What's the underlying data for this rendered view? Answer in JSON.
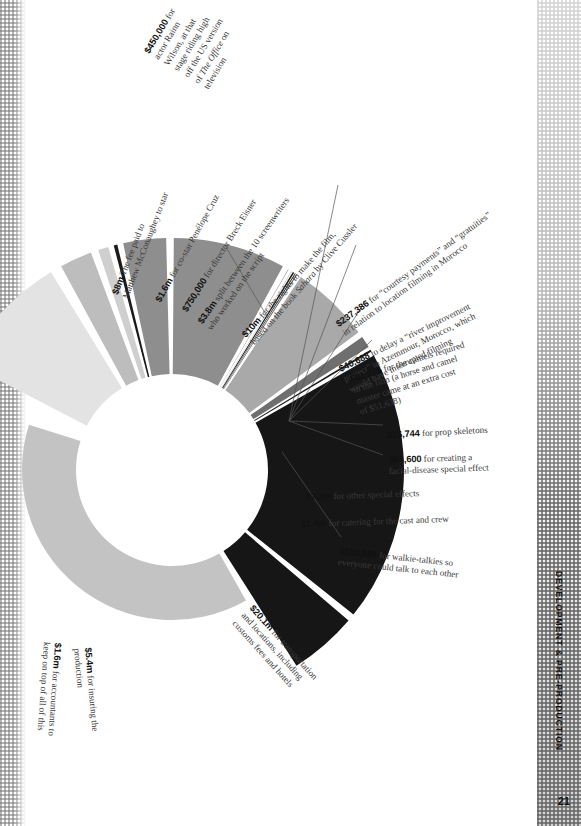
{
  "page": {
    "running_head": "DEVELOPMENT & PRE-PRODUCTION",
    "folio": "21"
  },
  "chart_data": {
    "type": "pie",
    "title": "",
    "subtitle": "",
    "xlabel": "",
    "ylabel": "",
    "legend_position": "callout-labels",
    "grid": false,
    "note": "Exploded doughnut of Sahara (2005) development & pre-production costs; slice angles approximate the printed figure, wedges separated by white gaps, ring cropped at the left page edge.",
    "categories": [
      "Matthew McConaughey fee",
      "Penelope Cruz fee",
      "Rainn Wilson fee",
      "Director Breck Eisner",
      "Screenwriters (10)",
      "Book rights (Sahara)",
      "Courtesy payments / gratuities",
      "River-improvement delay",
      "Camels",
      "Prop skeletons",
      "Facial-disease special effect",
      "Other special effects",
      "Catering",
      "Walkie-talkies",
      "Transportation & locations",
      "Production insurance",
      "Accountants"
    ],
    "values": [
      8000000,
      1600000,
      450000,
      750000,
      3800000,
      10000000,
      237386,
      40688,
      81375,
      16744,
      54600,
      7300000,
      1400000,
      102884,
      20100000,
      5400000,
      1600000
    ],
    "value_labels": [
      "$8m",
      "$1.6m",
      "$450,000",
      "$750,000",
      "$3.8m",
      "$10m",
      "$237,386",
      "$40,688",
      "$81,375",
      "$16,744",
      "$54,600",
      "$7.3m",
      "$1.4m",
      "$102,884",
      "$20.1m",
      "$5.4m",
      "$1.6m"
    ],
    "colors": [
      "#e3e3e3",
      "#bdbdbd",
      "#cfcfcf",
      "#1a1a1a",
      "#8e8e8e",
      "#8e8e8e",
      "#6f6f6f",
      "#d8d8d8",
      "#1a1a1a",
      "#1a1a1a",
      "#6f6f6f",
      "#a9a9a9",
      "#6f6f6f",
      "#1a1a1a",
      "#161616",
      "#161616",
      "#c3c3c3"
    ]
  },
  "callouts": [
    {
      "id": "rainn-wilson",
      "amount": "$450,000",
      "text": " for\nactor Rainn\nWilson, at that\nstage riding high\noff the US version\nof The Office on\ntelevision",
      "italic_part": "The Office"
    },
    {
      "id": "mcconaughey",
      "amount": "$8m",
      "text": " The fee paid to\nMatthew McConaughey to star"
    },
    {
      "id": "penelope-cruz",
      "amount": "$1.6m",
      "text": " for co-star Penélope Cruz"
    },
    {
      "id": "breck-eisner",
      "amount": "$750,000",
      "text": " for director Breck Eisner"
    },
    {
      "id": "screenwriters",
      "amount": "$3.8m",
      "text": " split between the 10 screenwriters\nwho worked on the script"
    },
    {
      "id": "book-rights",
      "amount": "$10m",
      "text": " for the rights to make the film,\nbased on the book Sahara by Clive Cussler",
      "italic_part": "Sahara"
    },
    {
      "id": "courtesy-payments",
      "amount": "$237,386",
      "text": " for “courtesy payments” and “gratuities”\nin relation to location filming in Morocco"
    },
    {
      "id": "river-improvement",
      "amount": "$40,688",
      "text": " to delay a “river improvement\nproject” in Azemmour, Morocco, which\nwould have interrupted filming"
    },
    {
      "id": "camels",
      "amount": "$81,375",
      "text": " for the camels required\nin the film (a horse and camel\nmaster came at an extra cost\nof $51,638)"
    },
    {
      "id": "prop-skeletons",
      "amount": "$16,744",
      "text": " for prop skeletons"
    },
    {
      "id": "facial-disease-fx",
      "amount": "$54,600",
      "text": " for creating a\nfacial-disease special effect"
    },
    {
      "id": "other-special-effects",
      "amount": "$7.3m",
      "text": " for other special effects"
    },
    {
      "id": "catering",
      "amount": "$1.4m",
      "text": " for catering for the cast and crew"
    },
    {
      "id": "walkie-talkies",
      "amount": "$102,884",
      "text": " for walkie-talkies so\neveryone could talk to each other"
    },
    {
      "id": "transportation",
      "amount": "$20.1m",
      "text": " for transportation\nand locations, including\ncustoms fees and hotels"
    },
    {
      "id": "insurance",
      "amount": "$5.4m",
      "text": " for insuring the\nproduction"
    },
    {
      "id": "accountants",
      "amount": "$1.6m",
      "text": " for accountants to\nkeep on top of all of this"
    }
  ]
}
